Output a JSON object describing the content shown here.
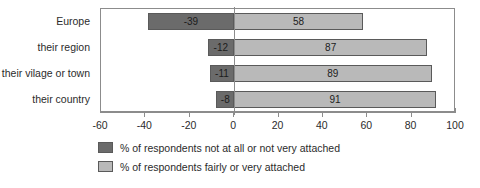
{
  "chart_data": {
    "type": "bar",
    "orientation": "horizontal",
    "layout": "diverging-stacked",
    "title": "",
    "subtitle": "",
    "xlabel": "",
    "ylabel": "",
    "xlim": [
      -60,
      100
    ],
    "xtick_step": 20,
    "xticks": [
      -60,
      -40,
      -20,
      0,
      20,
      40,
      60,
      80,
      100
    ],
    "xtick_labels": [
      "-60",
      "-40",
      "-20",
      "0",
      "20",
      "40",
      "60",
      "80",
      "100"
    ],
    "grid": false,
    "legend_position": "bottom",
    "categories": [
      "Europe",
      "their region",
      "their vilage or town",
      "their country"
    ],
    "series": [
      {
        "name": "% of respondents not at all or not very attached",
        "color": "#6b6b6b",
        "values": [
          -39,
          -12,
          -11,
          -8
        ],
        "value_labels": [
          "-39",
          "-12",
          "-11",
          "-8"
        ]
      },
      {
        "name": "% of respondents fairly or very attached",
        "color": "#b9b9b9",
        "values": [
          58,
          87,
          89,
          91
        ],
        "value_labels": [
          "58",
          "87",
          "89",
          "91"
        ]
      }
    ],
    "annotations": []
  },
  "legend": {
    "items": [
      {
        "label": "% of respondents not at all or not very attached",
        "color": "#6b6b6b"
      },
      {
        "label": "% of respondents fairly or very attached",
        "color": "#b9b9b9"
      }
    ]
  },
  "colors": {
    "negative_bar": "#6b6b6b",
    "positive_bar": "#b9b9b9",
    "bar_border": "#5a5a5a",
    "axis": "#8c8c8c",
    "text": "#2b2b2b",
    "background": "#ffffff"
  }
}
